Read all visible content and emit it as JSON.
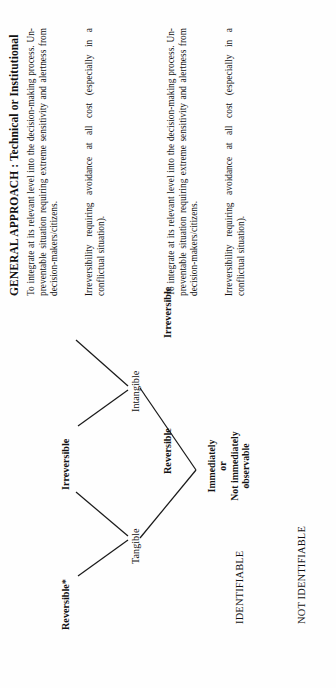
{
  "document": {
    "orientation": "rotated-90-ccw",
    "column_header": "GENERAL APPROACH : Technical or Institutional"
  },
  "categories": {
    "identifiable": "IDENTIFIABLE",
    "not_identifiable": "NOT IDENTIFIABLE"
  },
  "root": {
    "line1": "Immediately",
    "line2": "or",
    "line3": "Not immediately",
    "line4": "observable"
  },
  "branches": [
    {
      "name": "Tangible",
      "children": [
        {
          "label": "Reversible*",
          "description": "To integrate at its relevant level into the decision-making process. Un-preventable situation requiring extreme sensitivity and alertness from decision-makers/citizens."
        },
        {
          "label": "Irreversible",
          "description": "Irreversibility requiring avoidance at all cost (especially in a conflictual situation)."
        }
      ]
    },
    {
      "name": "Intangible",
      "children": [
        {
          "label": "Reversible",
          "description": "To integrate at its relevant level into the decision-making process. Un-preventable situation requiring extreme sensitivity and alertness from decision-makers/citizens."
        },
        {
          "label": "Irreversible",
          "description": "Irreversibility requiring avoidance at all cost (especially in a conflictual situation)."
        }
      ]
    }
  ],
  "colors": {
    "ink": "#111111",
    "page": "#fefefe",
    "line": "#1a1a1a"
  }
}
